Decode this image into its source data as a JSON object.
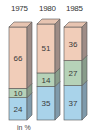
{
  "chart_data": {
    "type": "bar",
    "stacked": true,
    "style": "3d",
    "title": "",
    "xlabel": "",
    "ylabel": "",
    "unit_label": "in %",
    "categories": [
      "1975",
      "1980",
      "1985"
    ],
    "series": [
      {
        "name": "bottom (blue)",
        "color": "#a9d3ea",
        "values": [
          24,
          35,
          37
        ]
      },
      {
        "name": "middle (green)",
        "color": "#b6d2b8",
        "values": [
          10,
          14,
          27
        ]
      },
      {
        "name": "top (peach)",
        "color": "#f1cdb9",
        "values": [
          66,
          51,
          36
        ]
      }
    ],
    "ylim": [
      0,
      100
    ],
    "grid": false,
    "legend": "none"
  },
  "labels": {
    "year_1": "1975",
    "year_2": "1980",
    "year_3": "1985",
    "unit": "in %"
  }
}
